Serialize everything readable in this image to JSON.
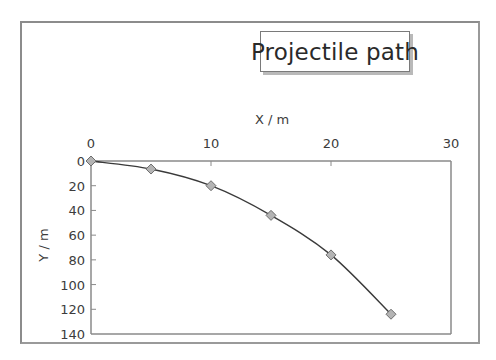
{
  "chart_data": {
    "type": "scatter",
    "title": "Projectile path",
    "xlabel": "X / m",
    "ylabel": "Y / m",
    "x_axis_position": "top",
    "y_axis_reversed": true,
    "xlim": [
      0,
      30
    ],
    "ylim": [
      0,
      140
    ],
    "x_ticks": [
      0,
      10,
      20,
      30
    ],
    "y_ticks": [
      0,
      20,
      40,
      60,
      80,
      100,
      120,
      140
    ],
    "grid": false,
    "legend": null,
    "marker": "diamond",
    "line": "smoothed curve through points",
    "series": [
      {
        "name": "Projectile path",
        "x": [
          0,
          5,
          10,
          15,
          20,
          25
        ],
        "y": [
          0,
          6.5,
          20,
          44,
          76,
          124
        ]
      }
    ]
  },
  "colors": {
    "marker_fill": "#b4b4b4",
    "marker_stroke": "#6e6e6e",
    "line": "#3a3a3a",
    "axis": "#8a8a8a",
    "frame": "#8c8c8c"
  }
}
